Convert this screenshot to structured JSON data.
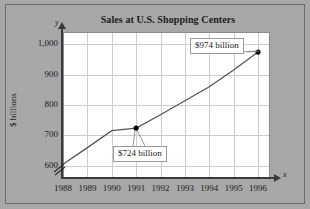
{
  "figure": {
    "title": "Sales at U.S. Shopping Centers",
    "y_axis_symbol": "y",
    "x_axis_symbol": "x",
    "y_axis_title": "$ billions",
    "background_color": "#a8a8a8",
    "plot_background_color": "#ffffff",
    "grid_color": "#cccccc",
    "axis_color": "#3a3a3a",
    "line_color": "#555555",
    "marker_color": "#000000"
  },
  "annotations": [
    {
      "id": "callout-724",
      "label": "$724 billion",
      "year": 1991,
      "value": 724
    },
    {
      "id": "callout-974",
      "label": "$974 billion",
      "year": 1996,
      "value": 974
    }
  ],
  "chart_data": {
    "type": "line",
    "title": "Sales at U.S. Shopping Centers",
    "xlabel": "x",
    "ylabel": "$ billions",
    "x": [
      1988,
      1989,
      1990,
      1991,
      1992,
      1993,
      1994,
      1995,
      1996
    ],
    "categories": [
      "1988",
      "1989",
      "1990",
      "1991",
      "1992",
      "1993",
      "1994",
      "1995",
      "1996"
    ],
    "values": [
      605,
      660,
      716,
      724,
      768,
      814,
      860,
      915,
      974
    ],
    "series": [
      {
        "name": "Sales",
        "values": [
          605,
          660,
          716,
          724,
          768,
          814,
          860,
          915,
          974
        ]
      }
    ],
    "xlim": [
      1988,
      1996
    ],
    "ylim": [
      560,
      1040
    ],
    "ytick_labels": [
      "600",
      "700",
      "800",
      "900",
      "1,000"
    ],
    "ytick_values": [
      600,
      700,
      800,
      900,
      1000
    ],
    "xtick_labels": [
      "1988",
      "1989",
      "1990",
      "1991",
      "1992",
      "1993",
      "1994",
      "1995",
      "1996"
    ],
    "grid": true,
    "legend": "none",
    "axis_break": "y-axis below 600",
    "markers": [
      {
        "year": 1991,
        "value": 724
      },
      {
        "year": 1996,
        "value": 974
      }
    ],
    "annotations": [
      "$724 billion",
      "$974 billion"
    ]
  }
}
